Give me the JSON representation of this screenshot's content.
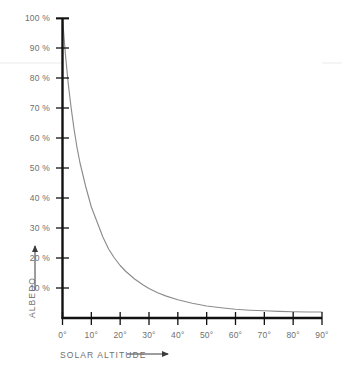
{
  "chart_data": {
    "type": "line",
    "title": "",
    "subtitle": "",
    "xlabel": "SOLAR ALTITUDE",
    "ylabel": "ALBEDO",
    "xlim": [
      0,
      90
    ],
    "ylim": [
      0,
      100
    ],
    "grid": false,
    "legend": null,
    "x_unit": "degrees",
    "y_unit": "percent",
    "xticks": [
      0,
      10,
      20,
      30,
      40,
      50,
      60,
      70,
      80,
      90
    ],
    "xtick_labels": [
      "0°",
      "10°",
      "20°",
      "30°",
      "40°",
      "50°",
      "60°",
      "70°",
      "80°",
      "90°"
    ],
    "yticks": [
      10,
      20,
      30,
      40,
      50,
      60,
      70,
      80,
      90,
      100
    ],
    "ytick_labels": [
      "10 %",
      "20 %",
      "30 %",
      "40 %",
      "50 %",
      "60 %",
      "70 %",
      "80 %",
      "90 %",
      "100 %"
    ],
    "series": [
      {
        "name": "albedo",
        "color": "#8c8c8c",
        "x": [
          0,
          1,
          2,
          3,
          4,
          5,
          6,
          8,
          10,
          12,
          14,
          16,
          18,
          20,
          22,
          25,
          28,
          30,
          33,
          36,
          40,
          45,
          50,
          55,
          60,
          65,
          70,
          75,
          80,
          85,
          90
        ],
        "values": [
          100,
          88,
          78,
          70,
          63,
          57,
          52,
          44,
          37,
          32,
          27,
          23,
          20,
          17.5,
          15.5,
          13,
          11,
          9.8,
          8.4,
          7.3,
          6.1,
          4.9,
          4.0,
          3.4,
          2.9,
          2.6,
          2.4,
          2.2,
          2.1,
          2.0,
          2.0
        ]
      }
    ],
    "annotations": [
      {
        "name": "faint-horizontal-rule",
        "type": "hline",
        "y": 85,
        "color": "#f2f2f2"
      }
    ],
    "axis_arrow_x": true,
    "axis_arrow_y": true,
    "colors": {
      "axis": "#111111",
      "curve": "#8c8c8c",
      "label": "#6f6f6f",
      "background": "#ffffff"
    }
  }
}
